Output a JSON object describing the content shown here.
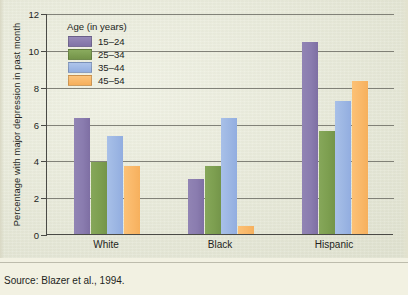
{
  "chart_data": {
    "type": "bar",
    "title": "",
    "xlabel": "",
    "ylabel": "Percentage with major depression in past month",
    "ylim": [
      0,
      12
    ],
    "yticks": [
      0,
      2,
      4,
      6,
      8,
      10,
      12
    ],
    "grid": true,
    "legend_position": "top-left",
    "legend_title": "Age (in years)",
    "categories": [
      "White",
      "Black",
      "Hispanic"
    ],
    "series": [
      {
        "name": "15–24",
        "color": "#8a7caf",
        "values": [
          6.3,
          3.0,
          10.4
        ]
      },
      {
        "name": "25–34",
        "color": "#7d9f50",
        "values": [
          3.9,
          3.7,
          5.6
        ]
      },
      {
        "name": "35–44",
        "color": "#9cb6e3",
        "values": [
          5.3,
          6.3,
          7.2
        ]
      },
      {
        "name": "45–54",
        "color": "#f9b869",
        "values": [
          3.7,
          0.45,
          8.3
        ]
      }
    ],
    "tick_labels": {
      "y": [
        "0",
        "2",
        "4",
        "6",
        "8",
        "10",
        "12"
      ],
      "x": [
        "White",
        "Black",
        "Hispanic"
      ]
    },
    "annotations": []
  },
  "source": {
    "text": "Source: Blazer et al., 1994."
  },
  "colors": {
    "background": "#eceedb",
    "axis": "#4a4a46",
    "gridline": "#6f6f66",
    "text": "#231f1c"
  }
}
